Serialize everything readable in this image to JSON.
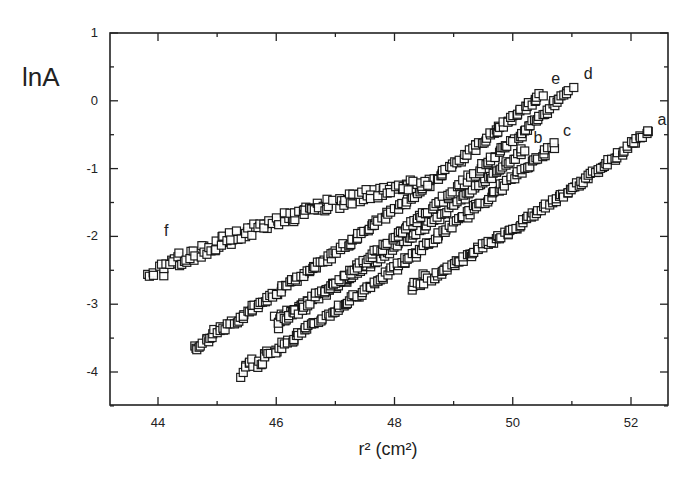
{
  "chart_data": {
    "type": "scatter",
    "title": "",
    "xlabel": "r² (cm²)",
    "ylabel": "lnA",
    "xlim": [
      43,
      53
    ],
    "ylim": [
      -4.5,
      1
    ],
    "x_ticks": [
      44,
      46,
      48,
      50,
      52
    ],
    "y_ticks": [
      1,
      0,
      -1,
      -2,
      -3,
      -4
    ],
    "grid": false,
    "legend": "none (curves labeled inline)",
    "marker": "open square",
    "series": [
      {
        "name": "a",
        "x_start": 48.3,
        "y_start": -2.75,
        "x_end": 52.3,
        "y_end": -0.45,
        "label_pos": [
          52.45,
          -0.35
        ]
      },
      {
        "name": "b",
        "x_start": 46.0,
        "y_start": -3.25,
        "x_end": 50.2,
        "y_end": -0.72,
        "label_pos": [
          50.35,
          -0.62
        ]
      },
      {
        "name": "c",
        "x_start": 45.4,
        "y_start": -4.0,
        "x_end": 50.7,
        "y_end": -0.65,
        "label_pos": [
          50.85,
          -0.52
        ]
      },
      {
        "name": "d",
        "x_start": 46.0,
        "y_start": -3.3,
        "x_end": 51.0,
        "y_end": 0.18,
        "label_pos": [
          51.2,
          0.32
        ]
      },
      {
        "name": "e",
        "x_start": 44.6,
        "y_start": -3.65,
        "x_end": 50.5,
        "y_end": 0.1,
        "label_pos": [
          50.65,
          0.25
        ]
      },
      {
        "name": "f",
        "x_start": 43.9,
        "y_start": -2.55,
        "x_end": 48.5,
        "y_end": -1.2,
        "label_pos": [
          44.1,
          -2.0
        ]
      }
    ]
  }
}
